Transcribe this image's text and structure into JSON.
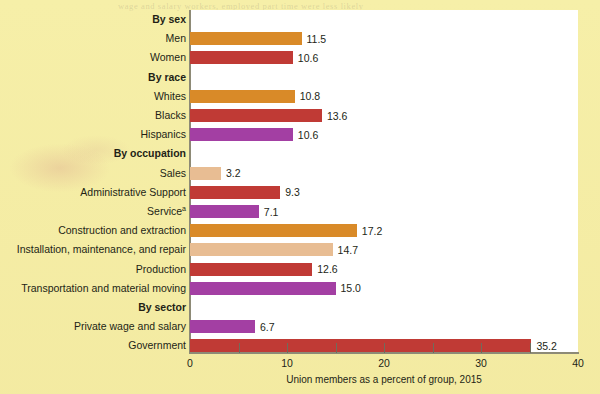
{
  "chart_data": {
    "type": "bar",
    "orientation": "horizontal",
    "title": "",
    "xlabel": "Union members as a percent of group, 2015",
    "ylabel": "",
    "xlim": [
      0,
      40
    ],
    "xticks": [
      0,
      10,
      20,
      30,
      40
    ],
    "xtick_labels": [
      "0",
      "10",
      "20",
      "30",
      "40"
    ],
    "xminor_ticks": [
      5,
      15,
      25,
      35
    ],
    "grid": false,
    "legend": "none",
    "groups": [
      {
        "heading": "By sex",
        "rows": [
          {
            "label": "Men",
            "value": 11.5,
            "value_label": "11.5",
            "color": "#d98a28"
          },
          {
            "label": "Women",
            "value": 10.6,
            "value_label": "10.6",
            "color": "#c03a35"
          }
        ]
      },
      {
        "heading": "By race",
        "rows": [
          {
            "label": "Whites",
            "value": 10.8,
            "value_label": "10.8",
            "color": "#d98a28"
          },
          {
            "label": "Blacks",
            "value": 13.6,
            "value_label": "13.6",
            "color": "#c03a35"
          },
          {
            "label": "Hispanics",
            "value": 10.6,
            "value_label": "10.6",
            "color": "#a33fa3"
          }
        ]
      },
      {
        "heading": "By occupation",
        "rows": [
          {
            "label": "Sales",
            "value": 3.2,
            "value_label": "3.2",
            "color": "#e8bd93"
          },
          {
            "label": "Administrative Support",
            "value": 9.3,
            "value_label": "9.3",
            "color": "#c03a35"
          },
          {
            "label": "Service",
            "superscript": "a",
            "value": 7.1,
            "value_label": "7.1",
            "color": "#a33fa3"
          },
          {
            "label": "Construction and extraction",
            "value": 17.2,
            "value_label": "17.2",
            "color": "#d98a28"
          },
          {
            "label": "Installation, maintenance, and repair",
            "value": 14.7,
            "value_label": "14.7",
            "color": "#e8bd93"
          },
          {
            "label": "Production",
            "value": 12.6,
            "value_label": "12.6",
            "color": "#c03a35"
          },
          {
            "label": "Transportation and material moving",
            "value": 15.0,
            "value_label": "15.0",
            "color": "#a33fa3"
          }
        ]
      },
      {
        "heading": "By sector",
        "rows": [
          {
            "label": "Private wage and salary",
            "value": 6.7,
            "value_label": "6.7",
            "color": "#a33fa3"
          },
          {
            "label": "Government",
            "value": 35.2,
            "value_label": "35.2",
            "color": "#c03a35"
          }
        ]
      }
    ]
  },
  "colors": {
    "background": "#f6efa8",
    "plot_background": "#ffffff",
    "axis": "#8d8a76",
    "text": "#231f16",
    "orange": "#d98a28",
    "red": "#c03a35",
    "purple": "#a33fa3",
    "tan": "#e8bd93"
  },
  "ghost_text": [
    "wage and salary workers, employed part time were less likely",
    "to be union members. In 2015, 12.3 percent of workers",
    "represented by unions were in the public sector."
  ]
}
